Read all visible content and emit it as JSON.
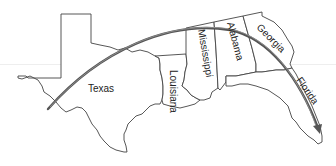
{
  "map": {
    "title": "",
    "states": [
      {
        "id": "texas",
        "label": "Texas"
      },
      {
        "id": "louisiana",
        "label": "Louisiana"
      },
      {
        "id": "mississippi",
        "label": "Mississippi"
      },
      {
        "id": "alabama",
        "label": "Alabama"
      },
      {
        "id": "georgia",
        "label": "Georgia"
      },
      {
        "id": "florida",
        "label": "Florida"
      }
    ],
    "route": {
      "from": "Texas",
      "to": "Florida",
      "style": "curved-arrow",
      "color": "#555555"
    },
    "colors": {
      "background": "#ffffff",
      "border": "#444444",
      "label": "#222222"
    }
  }
}
